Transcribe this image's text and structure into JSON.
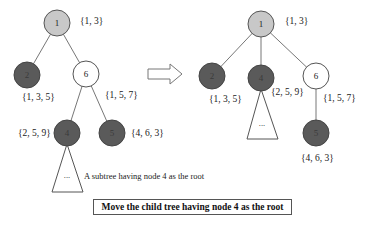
{
  "colors": {
    "root_fill": "#c8c8c8",
    "dark_fill": "#5a5a5a",
    "white_fill": "#ffffff",
    "stroke": "#555555",
    "edge": "#777777"
  },
  "before_tree": {
    "nodes": [
      {
        "id": "1",
        "label": "1",
        "set": "{1, 3}",
        "style": "root"
      },
      {
        "id": "2",
        "label": "2",
        "set": "{1, 3, 5}",
        "style": "dark"
      },
      {
        "id": "6",
        "label": "6",
        "set": "{1, 5, 7}",
        "style": "white"
      },
      {
        "id": "4",
        "label": "4",
        "set": "{2, 5, 9}",
        "style": "dark"
      },
      {
        "id": "5",
        "label": "5",
        "set": "{4, 6, 3}",
        "style": "dark"
      }
    ],
    "edges": [
      [
        "1",
        "2"
      ],
      [
        "1",
        "6"
      ],
      [
        "6",
        "4"
      ],
      [
        "6",
        "5"
      ]
    ],
    "subtree_label": "...",
    "subtree_note": "A subtree having node 4 as the root"
  },
  "arrow": {
    "direction": "right"
  },
  "after_tree": {
    "nodes": [
      {
        "id": "1",
        "label": "1",
        "set": "{1, 3}",
        "style": "root"
      },
      {
        "id": "2",
        "label": "2",
        "set": "{1, 3, 5}",
        "style": "dark"
      },
      {
        "id": "4",
        "label": "4",
        "set": "{2, 5, 9}",
        "style": "dark"
      },
      {
        "id": "6",
        "label": "6",
        "set": "{1, 5, 7}",
        "style": "white"
      },
      {
        "id": "5",
        "label": "5",
        "set": "{4, 6, 3}",
        "style": "dark"
      }
    ],
    "edges": [
      [
        "1",
        "2"
      ],
      [
        "1",
        "4"
      ],
      [
        "1",
        "6"
      ],
      [
        "6",
        "5"
      ]
    ],
    "subtree_label": "..."
  },
  "caption": "Move the child tree having node 4 as the root"
}
